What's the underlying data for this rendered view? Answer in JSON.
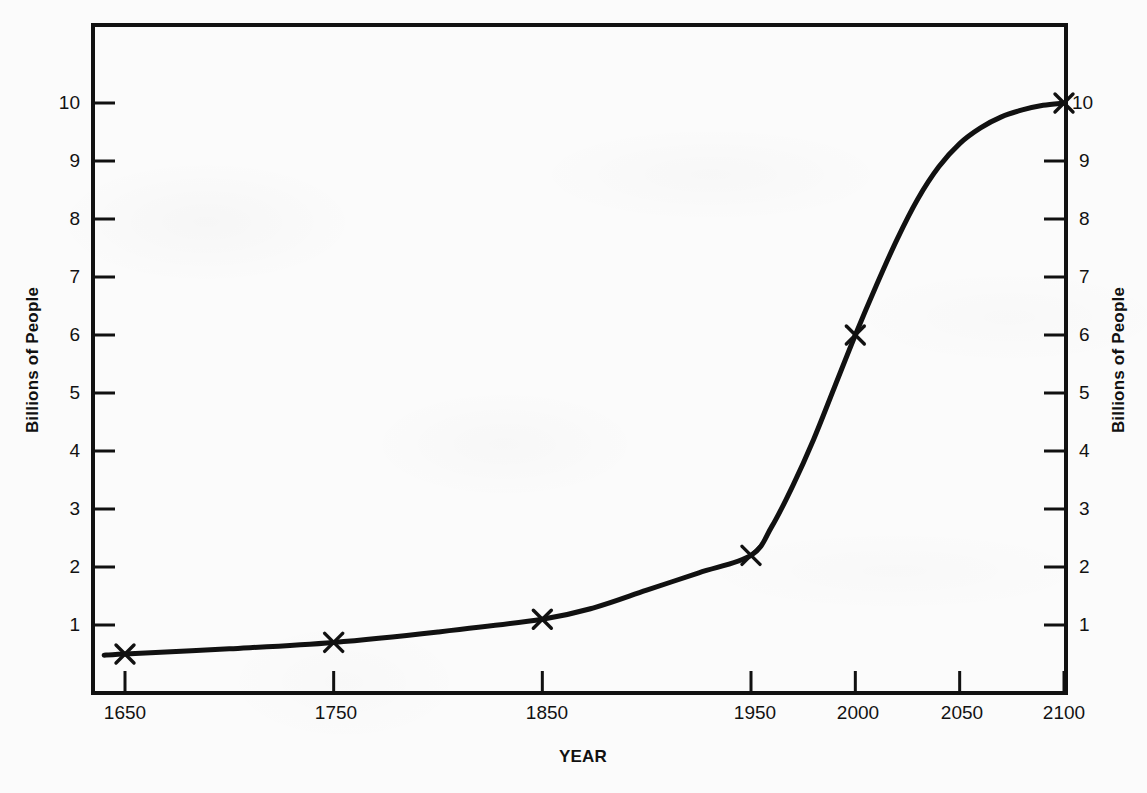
{
  "chart_data": {
    "type": "line",
    "title": "",
    "subtitle": "",
    "xlabel": "YEAR",
    "ylabel": "Billions of People",
    "ylabel_right": "Billions of People",
    "xlim": [
      1640,
      2100
    ],
    "ylim": [
      0,
      10.55
    ],
    "grid": false,
    "legend": null,
    "series": [
      {
        "name": "World population",
        "marker": "x",
        "line_color": "#111111",
        "x": [
          1650,
          1750,
          1850,
          1950,
          2000,
          2100
        ],
        "y": [
          0.5,
          0.7,
          1.1,
          2.2,
          6.0,
          10.0
        ],
        "marked_points": [
          {
            "x": 1650,
            "y": 0.5
          },
          {
            "x": 1750,
            "y": 0.7
          },
          {
            "x": 1850,
            "y": 1.1
          },
          {
            "x": 1950,
            "y": 2.2
          },
          {
            "x": 2000,
            "y": 6.0
          },
          {
            "x": 2100,
            "y": 10.0
          }
        ],
        "curve_points": [
          {
            "x": 1640,
            "y": 0.48
          },
          {
            "x": 1650,
            "y": 0.5
          },
          {
            "x": 1700,
            "y": 0.59
          },
          {
            "x": 1750,
            "y": 0.7
          },
          {
            "x": 1800,
            "y": 0.88
          },
          {
            "x": 1850,
            "y": 1.1
          },
          {
            "x": 1875,
            "y": 1.3
          },
          {
            "x": 1900,
            "y": 1.6
          },
          {
            "x": 1925,
            "y": 1.9
          },
          {
            "x": 1950,
            "y": 2.2
          },
          {
            "x": 1960,
            "y": 2.7
          },
          {
            "x": 1970,
            "y": 3.4
          },
          {
            "x": 1980,
            "y": 4.2
          },
          {
            "x": 1990,
            "y": 5.1
          },
          {
            "x": 2000,
            "y": 6.0
          },
          {
            "x": 2010,
            "y": 6.85
          },
          {
            "x": 2020,
            "y": 7.65
          },
          {
            "x": 2030,
            "y": 8.35
          },
          {
            "x": 2040,
            "y": 8.9
          },
          {
            "x": 2050,
            "y": 9.3
          },
          {
            "x": 2060,
            "y": 9.57
          },
          {
            "x": 2070,
            "y": 9.76
          },
          {
            "x": 2080,
            "y": 9.88
          },
          {
            "x": 2090,
            "y": 9.96
          },
          {
            "x": 2100,
            "y": 10.0
          }
        ]
      }
    ],
    "x_ticks": [
      {
        "value": 1650,
        "label": "1650"
      },
      {
        "value": 1750,
        "label": "1750"
      },
      {
        "value": 1850,
        "label": "1850"
      },
      {
        "value": 1950,
        "label": "1950"
      },
      {
        "value": 2000,
        "label": "2000"
      },
      {
        "value": 2050,
        "label": "2050"
      },
      {
        "value": 2100,
        "label": "2100"
      }
    ],
    "y_ticks": [
      {
        "value": 1,
        "label": "1"
      },
      {
        "value": 2,
        "label": "2"
      },
      {
        "value": 3,
        "label": "3"
      },
      {
        "value": 4,
        "label": "4"
      },
      {
        "value": 5,
        "label": "5"
      },
      {
        "value": 6,
        "label": "6"
      },
      {
        "value": 7,
        "label": "7"
      },
      {
        "value": 8,
        "label": "8"
      },
      {
        "value": 9,
        "label": "9"
      },
      {
        "value": 10,
        "label": "10"
      }
    ],
    "colors": {
      "background": "#fbfbfb",
      "axis": "#111111",
      "line": "#111111",
      "text": "#121212"
    }
  },
  "xticks_text": {
    "t0": "1650",
    "t1": "1750",
    "t2": "1850",
    "t3": "1950",
    "t4": "2000",
    "t5": "2050",
    "t6": "2100"
  },
  "yticks_text": {
    "y1": "1",
    "y2": "2",
    "y3": "3",
    "y4": "4",
    "y5": "5",
    "y6": "6",
    "y7": "7",
    "y8": "8",
    "y9": "9",
    "y10": "10"
  },
  "labels": {
    "x_axis_title": "YEAR",
    "y_axis_title_left": "Billions of People",
    "y_axis_title_right": "Billions of People"
  }
}
